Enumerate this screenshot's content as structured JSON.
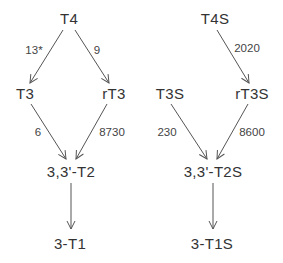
{
  "diagrams": [
    {
      "name": "non-sulfated",
      "nodes": {
        "t4": "T4",
        "t3": "T3",
        "rt3": "rT3",
        "t2": "3,3'-T2",
        "t1": "3-T1"
      },
      "edges": {
        "t4_t3": "13*",
        "t4_rt3": "9",
        "t3_t2": "6",
        "rt3_t2": "8730"
      }
    },
    {
      "name": "sulfated",
      "nodes": {
        "t4s": "T4S",
        "t3s": "T3S",
        "rt3s": "rT3S",
        "t2s": "3,3'-T2S",
        "t1s": "3-T1S"
      },
      "edges": {
        "t4s_rt3s": "2020",
        "t3s_t2s": "230",
        "rt3s_t2s": "8600"
      }
    }
  ],
  "colors": {
    "arrow": "#555555",
    "text": "#333333",
    "background": "#ffffff"
  }
}
